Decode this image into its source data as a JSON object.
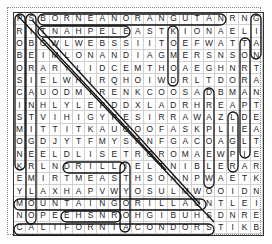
{
  "puzzle": {
    "rows": [
      "PSBORNEANORANGUTANRNG",
      "RITNAHPELEASTKIONAELI",
      "OBGWLWEBSSIITOEFWATTA",
      "BEIMLONANDIAGMERSNSON",
      "ORARYLIDCEMTHOAEGHNRT",
      "SIELWHIRQHOIWDRLTDORA",
      "CAUODMIRENKCOOSADBMAN",
      "INHLYLEPDDXLADRHREAPT",
      "STVIHIGYPESIRRAWAZLDE",
      "MITTITKAUOOOFASKPLIEA",
      "OGDJYTFMYSPNFGACOAGLT",
      "NEELDLISETROROMAEWPIE",
      "KRLNDRILLIELTNIBLERAR",
      "EMIRTMEASTHSOANPWAETK",
      "YLAXHAPVWYOSULMWOOIDN",
      "MOUNTAINGORILLAUNTLEI",
      "NOPEEHSNROHGIBUHSDNRE",
      "CALIFORNIACONDORSTIKB"
    ],
    "found_words": [
      "BORNEAN ORANGUTAN",
      "ELEPHANT",
      "MOUNTAIN GORILLA",
      "CALIFORNIA CONDOR",
      "DRILL",
      "RHINO",
      "IBEX",
      "KIT FOX"
    ]
  }
}
